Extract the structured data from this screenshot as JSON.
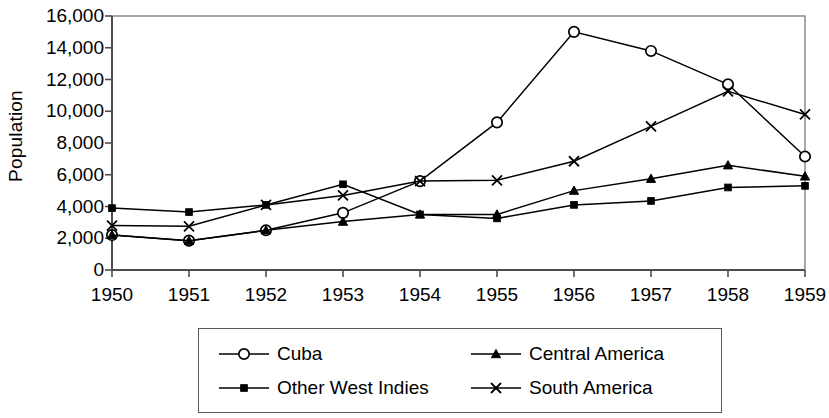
{
  "chart_data": {
    "type": "line",
    "title": "",
    "xlabel": "",
    "ylabel": "Population",
    "categories": [
      "1950",
      "1951",
      "1952",
      "1953",
      "1954",
      "1955",
      "1956",
      "1957",
      "1958",
      "1959"
    ],
    "x": [
      1950,
      1951,
      1952,
      1953,
      1954,
      1955,
      1956,
      1957,
      1958,
      1959
    ],
    "ylim": [
      0,
      16000
    ],
    "ytick_labels": [
      "16,000",
      "14,000",
      "12,000",
      "10,000",
      "8,000",
      "6,000",
      "4,000",
      "2,000",
      "0"
    ],
    "ytick_values": [
      16000,
      14000,
      12000,
      10000,
      8000,
      6000,
      4000,
      2000,
      0
    ],
    "grid": false,
    "legend_position": "bottom",
    "series": [
      {
        "name": "Cuba",
        "marker": "open-circle",
        "values": [
          2200,
          1850,
          2500,
          3600,
          5600,
          9300,
          15000,
          13800,
          11700,
          7150
        ]
      },
      {
        "name": "Other West Indies",
        "marker": "filled-square",
        "values": [
          3900,
          3650,
          4100,
          5400,
          3500,
          3250,
          4100,
          4350,
          5200,
          5300
        ]
      },
      {
        "name": "Central America",
        "marker": "filled-triangle",
        "values": [
          2200,
          1850,
          2500,
          3050,
          3500,
          3500,
          5000,
          5750,
          6600,
          5900
        ]
      },
      {
        "name": "South America",
        "marker": "cross-x",
        "values": [
          2800,
          2750,
          4100,
          4700,
          5600,
          5650,
          6850,
          9050,
          11250,
          9800
        ]
      }
    ]
  },
  "colors": {
    "line": "#000000",
    "axis": "#4d4d4d",
    "plot_border": "#6e6e6e",
    "background": "#ffffff"
  },
  "legend": {
    "entries": [
      {
        "label": "Cuba",
        "marker": "open-circle"
      },
      {
        "label": "Central America",
        "marker": "filled-triangle"
      },
      {
        "label": "Other West Indies",
        "marker": "filled-square"
      },
      {
        "label": "South America",
        "marker": "cross-x"
      }
    ]
  }
}
